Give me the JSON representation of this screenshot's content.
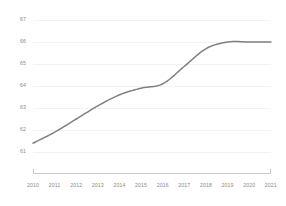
{
  "chart_data": {
    "type": "line",
    "title": "",
    "subtitle": "",
    "xlabel": "",
    "ylabel": "",
    "categories": [
      "2010",
      "2011",
      "2012",
      "2013",
      "2014",
      "2015",
      "2016",
      "2017",
      "2018",
      "2019",
      "2020",
      "2021"
    ],
    "x": [
      2010,
      2011,
      2012,
      2013,
      2014,
      2015,
      2016,
      2017,
      2018,
      2019,
      2020,
      2021
    ],
    "series": [
      {
        "name": "",
        "values": [
          61.4,
          61.9,
          62.5,
          63.1,
          63.6,
          63.9,
          64.1,
          64.9,
          65.7,
          66.0,
          66.0,
          66.0
        ]
      }
    ],
    "values": [
      61.4,
      61.9,
      62.5,
      63.1,
      63.6,
      63.9,
      64.1,
      64.9,
      65.7,
      66.0,
      66.0,
      66.0
    ],
    "ylim": [
      61,
      67
    ],
    "xlim": [
      2010,
      2021
    ],
    "yticks": [
      61,
      62,
      63,
      64,
      65,
      66,
      67
    ],
    "ytick_labels": [
      "61",
      "62",
      "63",
      "64",
      "65",
      "66",
      "67"
    ],
    "xtick_labels": [
      "2010",
      "2011",
      "2012",
      "2013",
      "2014",
      "2015",
      "2016",
      "2017",
      "2018",
      "2019",
      "2020",
      "2021"
    ],
    "grid": true,
    "grid_axis": "y",
    "legend": false,
    "legend_position": "none",
    "annotations": [],
    "colors": {
      "line": "#808080",
      "grid": "#f2f2f2",
      "axis": "#c9c9c9",
      "tick_text": "#8a8a8a",
      "background": "#ffffff"
    },
    "line_width": 1.5
  }
}
